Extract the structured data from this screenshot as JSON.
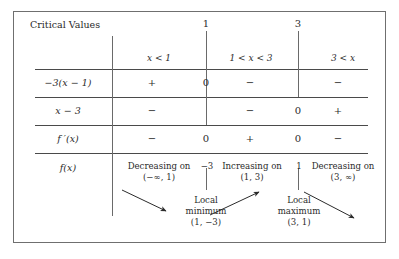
{
  "table": {
    "title": "Critical Values",
    "critical_values": [
      "1",
      "3"
    ],
    "interval_headers": [
      "x < 1",
      "1 < x < 3",
      "3 < x"
    ],
    "rows": [
      {
        "label": "−3(x − 1)",
        "signs": [
          "+",
          "0",
          "−",
          "−"
        ]
      },
      {
        "label": "x − 3",
        "signs": [
          "−",
          "−",
          "0",
          "+"
        ]
      },
      {
        "label": "f ′(x)",
        "signs": [
          "−",
          "0",
          "+",
          "0",
          "−"
        ]
      }
    ],
    "function_row": {
      "label": "f(x)",
      "behaviors": [
        {
          "text1": "Decreasing on",
          "text2": "(−∞, 1)"
        },
        {
          "text1": "Increasing on",
          "text2": "(1, 3)"
        },
        {
          "text1": "Decreasing on",
          "text2": "(3, ∞)"
        }
      ],
      "tick_labels": [
        "−3",
        "1"
      ],
      "extrema": [
        {
          "text1": "Local",
          "text2": "minimum",
          "point": "(1, −3)"
        },
        {
          "text1": "Local",
          "text2": "maximum",
          "point": "(3, 1)"
        }
      ]
    },
    "colors": {
      "border": "#6f6f6f",
      "rule": "#4a4a4a",
      "text": "#2b2b2b"
    }
  }
}
